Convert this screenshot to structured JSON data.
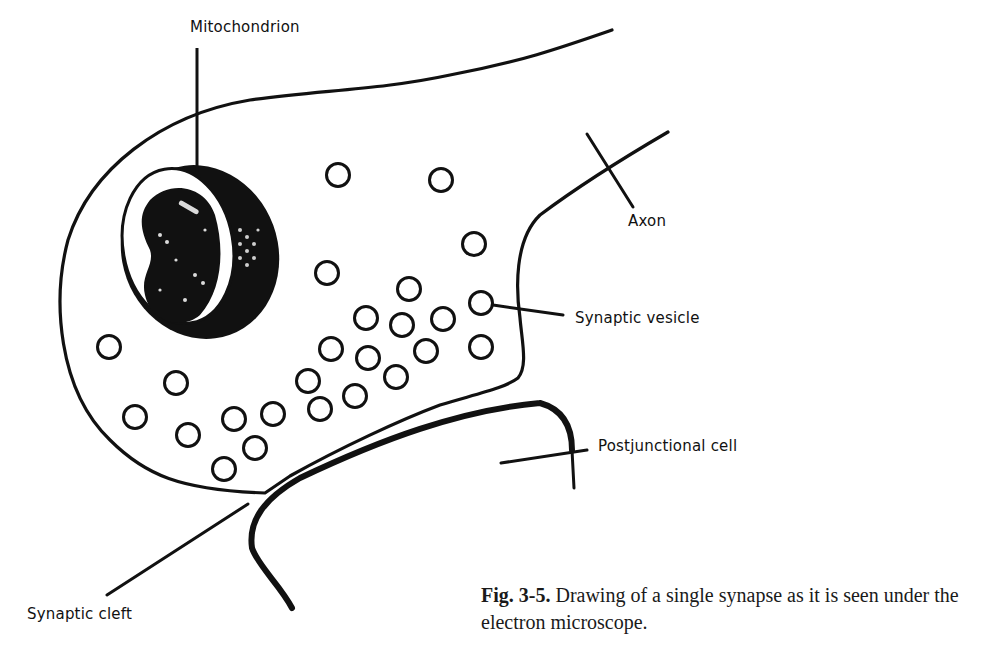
{
  "figure": {
    "labels": {
      "mitochondrion": "Mitochondrion",
      "axon": "Axon",
      "synaptic_vesicle": "Synaptic vesicle",
      "postjunctional_cell": "Postjunctional cell",
      "synaptic_cleft": "Synaptic cleft"
    },
    "caption": {
      "number": "Fig. 3-5.",
      "text": " Drawing of a single synapse as it is seen under the electron microscope."
    },
    "colors": {
      "ink": "#111111",
      "background": "#ffffff"
    },
    "vesicles": [
      [
        338,
        175
      ],
      [
        441,
        180
      ],
      [
        474,
        244
      ],
      [
        327,
        273
      ],
      [
        409,
        289
      ],
      [
        481,
        303
      ],
      [
        366,
        318
      ],
      [
        402,
        325
      ],
      [
        443,
        319
      ],
      [
        109,
        347
      ],
      [
        331,
        349
      ],
      [
        368,
        358
      ],
      [
        426,
        351
      ],
      [
        481,
        347
      ],
      [
        176,
        383
      ],
      [
        308,
        381
      ],
      [
        396,
        377
      ],
      [
        135,
        417
      ],
      [
        320,
        409
      ],
      [
        355,
        396
      ],
      [
        234,
        419
      ],
      [
        273,
        414
      ],
      [
        188,
        435
      ],
      [
        255,
        448
      ],
      [
        224,
        469
      ]
    ]
  }
}
